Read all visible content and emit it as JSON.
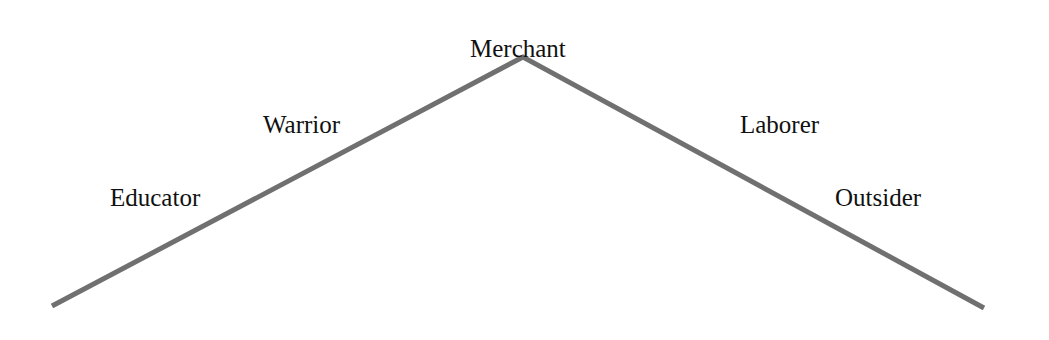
{
  "diagram": {
    "type": "inverted-v hierarchy",
    "peak_label": "Merchant",
    "left_slope": [
      "Educator",
      "Warrior"
    ],
    "right_slope": [
      "Laborer",
      "Outsider"
    ],
    "labels": {
      "merchant": "Merchant",
      "warrior": "Warrior",
      "educator": "Educator",
      "laborer": "Laborer",
      "outsider": "Outsider"
    },
    "line_color": "#6e6e6e"
  }
}
